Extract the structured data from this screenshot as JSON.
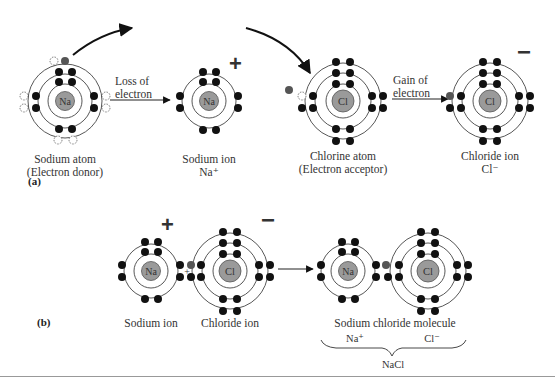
{
  "part_a": {
    "label": "(a)",
    "sodium_atom": {
      "symbol": "Na",
      "caption_line1": "Sodium atom",
      "caption_line2": "(Electron donor)"
    },
    "loss_arrow": {
      "line1": "Loss of",
      "line2": "electron"
    },
    "sodium_ion": {
      "symbol": "Na",
      "caption_line1": "Sodium ion",
      "caption_line2": "Na⁺",
      "charge": "+"
    },
    "chlorine_atom": {
      "symbol": "Cl",
      "caption_line1": "Chlorine atom",
      "caption_line2": "(Electron acceptor)"
    },
    "gain_arrow": {
      "line1": "Gain of",
      "line2": "electron"
    },
    "chloride_ion": {
      "symbol": "Cl",
      "caption_line1": "Chloride ion",
      "caption_line2": "Cl⁻",
      "charge": "−"
    }
  },
  "part_b": {
    "label": "(b)",
    "sodium_ion": {
      "symbol": "Na",
      "caption": "Sodium ion",
      "charge": "+"
    },
    "plus_sign": "+",
    "chloride_ion": {
      "symbol": "Cl",
      "caption": "Chloride ion",
      "charge": "−"
    },
    "molecule": {
      "na_symbol": "Na",
      "cl_symbol": "Cl",
      "caption": "Sodium chloride molecule",
      "na_ion_label": "Na⁺",
      "cl_ion_label": "Cl⁻",
      "formula": "NaCl"
    }
  },
  "colors": {
    "electron": "#111111",
    "transferred_electron": "#555555",
    "nucleus": "#9a9a9a",
    "orbit": "#444444"
  }
}
